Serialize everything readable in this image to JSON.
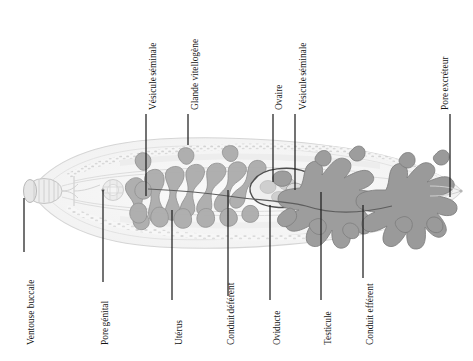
{
  "figure": {
    "kind": "anatomical-diagram",
    "language": "fr",
    "colors": {
      "background": "#ffffff",
      "leader_line": "#1f1f1f",
      "text": "#131313",
      "body_outline": "#d8d8d8",
      "body_fill": "#f4f4f4",
      "uterus": "#a9a9a9",
      "uterus_outline": "#8c8c8c",
      "testis": "#9b9b9b",
      "testis_outline": "#7e7e7e",
      "ovary_outline": "#4a4a4a",
      "ovary_fill": "#ededed",
      "vitelline_speckle": "#cfcfcf",
      "sucker": "#e2e2e2"
    },
    "labels": [
      {
        "id": "vesicule-seminale-top",
        "name": "Vésicule séminale",
        "lines": [
          "Vésicule",
          "séminale"
        ],
        "side": "top",
        "text_x": 148,
        "text_y": 110,
        "leader": {
          "x1": 146,
          "y1": 114,
          "x2": 146,
          "y2": 196
        }
      },
      {
        "id": "glande-vitellogene",
        "name": "Glande vitellogène",
        "lines": [
          "Glande vitellogène"
        ],
        "side": "top",
        "text_x": 190,
        "text_y": 110,
        "leader": {
          "x1": 188,
          "y1": 114,
          "x2": 188,
          "y2": 145
        }
      },
      {
        "id": "ovaire",
        "name": "Ovaire",
        "lines": [
          "Ovaire"
        ],
        "side": "top",
        "text_x": 274,
        "text_y": 110,
        "leader": {
          "x1": 273,
          "y1": 114,
          "x2": 273,
          "y2": 182
        }
      },
      {
        "id": "vesicule-seminale-mid",
        "name": "Vésicule séminale",
        "lines": [
          "Vésicule",
          "séminale"
        ],
        "side": "top",
        "text_x": 298,
        "text_y": 110,
        "leader": {
          "x1": 295,
          "y1": 114,
          "x2": 295,
          "y2": 190
        }
      },
      {
        "id": "pore-excreteur",
        "name": "Pore excréteur",
        "lines": [
          "Pore",
          "excréteur"
        ],
        "side": "top",
        "text_x": 440,
        "text_y": 110,
        "leader": {
          "x1": 450,
          "y1": 114,
          "x2": 450,
          "y2": 197
        }
      },
      {
        "id": "ventouse-buccale",
        "name": "Ventouse buccale",
        "lines": [
          "Ventouse buccale"
        ],
        "side": "bottom",
        "text_x": 26,
        "text_y": 345,
        "leader": {
          "x1": 24,
          "y1": 252,
          "x2": 24,
          "y2": 198
        }
      },
      {
        "id": "pore-genital",
        "name": "Pore génital",
        "lines": [
          "Pore",
          "génital"
        ],
        "side": "bottom",
        "text_x": 100,
        "text_y": 345,
        "leader": {
          "x1": 103,
          "y1": 282,
          "x2": 103,
          "y2": 190
        }
      },
      {
        "id": "uterus",
        "name": "Utérus",
        "lines": [
          "Utérus"
        ],
        "side": "bottom",
        "text_x": 174,
        "text_y": 345,
        "leader": {
          "x1": 172,
          "y1": 300,
          "x2": 172,
          "y2": 210
        }
      },
      {
        "id": "conduit-deferent",
        "name": "Conduit déférent",
        "lines": [
          "Conduit",
          "déférent"
        ],
        "side": "bottom",
        "text_x": 226,
        "text_y": 345,
        "leader": {
          "x1": 228,
          "y1": 296,
          "x2": 228,
          "y2": 190
        }
      },
      {
        "id": "oviducte",
        "name": "Oviducte",
        "lines": [
          "Oviducte"
        ],
        "side": "bottom",
        "text_x": 272,
        "text_y": 345,
        "leader": {
          "x1": 270,
          "y1": 300,
          "x2": 270,
          "y2": 205
        }
      },
      {
        "id": "testicule",
        "name": "Testicule",
        "lines": [
          "Testicule"
        ],
        "side": "bottom",
        "text_x": 323,
        "text_y": 345,
        "leader": {
          "x1": 321,
          "y1": 300,
          "x2": 321,
          "y2": 192
        }
      },
      {
        "id": "conduit-efferent",
        "name": "Conduit efférent",
        "lines": [
          "Conduit efférent"
        ],
        "side": "bottom",
        "text_x": 365,
        "text_y": 345,
        "leader": {
          "x1": 363,
          "y1": 278,
          "x2": 363,
          "y2": 205
        }
      }
    ],
    "structures": [
      {
        "id": "oral-sucker",
        "name": "Ventouse buccale",
        "note": "barrel, striated, anterior tip"
      },
      {
        "id": "body-outline",
        "name": "Corps",
        "note": "leaf / lanceolate outline"
      },
      {
        "id": "uterus-coils",
        "name": "Utérus",
        "note": "convoluted median coils, anterior half"
      },
      {
        "id": "ovary",
        "name": "Ovaire",
        "note": "outlined oval, mid body"
      },
      {
        "id": "testis-anterior",
        "name": "Testicule antérieur",
        "note": "dendritic branched"
      },
      {
        "id": "testis-posterior",
        "name": "Testicule postérieur",
        "note": "dendritic branched"
      },
      {
        "id": "vitelline-glands",
        "name": "Glande vitellogène",
        "note": "lateral speckled fields"
      },
      {
        "id": "excretory-pore",
        "name": "Pore excréteur",
        "note": "posterior tip"
      },
      {
        "id": "genital-pore",
        "name": "Pore génital",
        "note": "ventral, anterior third"
      }
    ]
  }
}
